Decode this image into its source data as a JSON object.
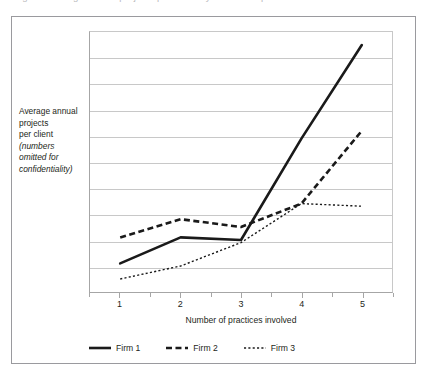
{
  "figure": {
    "caption_top_cut": "Figure: Average annual projects per client by number of practices involved",
    "y_axis_caption_line1": "Average annual",
    "y_axis_caption_line2": "projects",
    "y_axis_caption_line3": "per client",
    "y_axis_caption_italic1": "(numbers",
    "y_axis_caption_italic2": "omitted for",
    "y_axis_caption_italic3": "confidentiality)"
  },
  "colors": {
    "series_color": "#1a1a1a",
    "gridline": "#c8c8c8",
    "axis": "#a6a6a6",
    "frame": "#9a9a9e",
    "text": "#231f20",
    "background": "#ffffff"
  },
  "legend": {
    "position": "bottom",
    "items": [
      {
        "label": "Firm 1",
        "style": "solid",
        "width": 2.6
      },
      {
        "label": "Firm 2",
        "style": "dashed",
        "width": 2.6
      },
      {
        "label": "Firm 3",
        "style": "dotted",
        "width": 1.4
      }
    ]
  },
  "chart_data": {
    "type": "line",
    "title": "",
    "xlabel": "Number of practices involved",
    "ylabel": "Average annual projects per client (numbers omitted for confidentiality)",
    "categories": [
      "1",
      "2",
      "3",
      "4",
      "5"
    ],
    "x": [
      1,
      2,
      3,
      4,
      5
    ],
    "ylim": [
      0,
      100
    ],
    "xlim": [
      0.5,
      5.5
    ],
    "y_tick_labels": [],
    "grid": "horizontal",
    "gridline_count": 9,
    "y_axis_values_omitted": true,
    "series": [
      {
        "name": "Firm 1",
        "style": "solid",
        "values": [
          11,
          21,
          20,
          59,
          95
        ]
      },
      {
        "name": "Firm 2",
        "style": "dashed",
        "values": [
          21,
          28,
          25,
          34,
          62
        ]
      },
      {
        "name": "Firm 3",
        "style": "dotted",
        "values": [
          5,
          10,
          19,
          34,
          33
        ]
      }
    ]
  }
}
